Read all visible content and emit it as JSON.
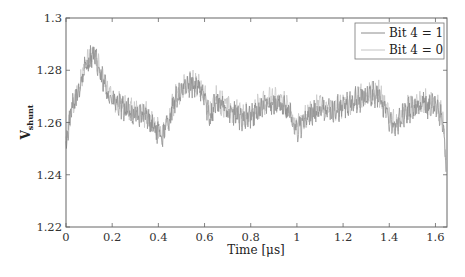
{
  "chart_data": {
    "type": "line",
    "title": "",
    "xlabel": "Time [μs]",
    "ylabel": "V_shunt",
    "ylabel_main": "V",
    "ylabel_sub": "shunt",
    "xlim": [
      0,
      1.65
    ],
    "ylim": [
      1.22,
      1.3
    ],
    "xticks": [
      0,
      0.2,
      0.4,
      0.6,
      0.8,
      1,
      1.2,
      1.4,
      1.6
    ],
    "xtick_labels": [
      "0",
      "0.2",
      "0.4",
      "0.6",
      "0.8",
      "1",
      "1.2",
      "1.4",
      "1.6"
    ],
    "yticks": [
      1.22,
      1.24,
      1.26,
      1.28,
      1.3
    ],
    "ytick_labels": [
      "1.22",
      "1.24",
      "1.26",
      "1.28",
      "1.3"
    ],
    "grid": false,
    "legend_position": "upper right",
    "series": [
      {
        "name": "Bit 4 = 1",
        "color": "#8c8c8c",
        "x": [
          0,
          0.01,
          0.03,
          0.05,
          0.08,
          0.1,
          0.12,
          0.15,
          0.18,
          0.2,
          0.25,
          0.3,
          0.35,
          0.38,
          0.4,
          0.42,
          0.45,
          0.48,
          0.5,
          0.55,
          0.6,
          0.62,
          0.65,
          0.7,
          0.75,
          0.8,
          0.85,
          0.9,
          0.95,
          1.0,
          1.05,
          1.1,
          1.15,
          1.2,
          1.25,
          1.3,
          1.35,
          1.4,
          1.43,
          1.45,
          1.5,
          1.55,
          1.6,
          1.63,
          1.645
        ],
        "values": [
          1.25,
          1.258,
          1.266,
          1.271,
          1.28,
          1.284,
          1.286,
          1.278,
          1.272,
          1.268,
          1.265,
          1.263,
          1.262,
          1.258,
          1.256,
          1.255,
          1.262,
          1.27,
          1.272,
          1.275,
          1.27,
          1.262,
          1.268,
          1.265,
          1.262,
          1.262,
          1.266,
          1.268,
          1.266,
          1.257,
          1.262,
          1.266,
          1.264,
          1.266,
          1.268,
          1.27,
          1.271,
          1.262,
          1.258,
          1.262,
          1.266,
          1.267,
          1.266,
          1.262,
          1.245
        ]
      },
      {
        "name": "Bit 4 = 0",
        "color": "#c4c4c4",
        "x": [
          0,
          0.01,
          0.03,
          0.05,
          0.08,
          0.1,
          0.12,
          0.15,
          0.18,
          0.2,
          0.25,
          0.3,
          0.35,
          0.38,
          0.4,
          0.42,
          0.45,
          0.48,
          0.5,
          0.55,
          0.6,
          0.62,
          0.65,
          0.7,
          0.75,
          0.8,
          0.85,
          0.9,
          0.95,
          1.0,
          1.05,
          1.1,
          1.15,
          1.2,
          1.25,
          1.3,
          1.35,
          1.4,
          1.43,
          1.45,
          1.5,
          1.55,
          1.6,
          1.63,
          1.645
        ],
        "values": [
          1.251,
          1.259,
          1.267,
          1.272,
          1.281,
          1.285,
          1.287,
          1.279,
          1.273,
          1.269,
          1.266,
          1.264,
          1.263,
          1.259,
          1.257,
          1.256,
          1.263,
          1.271,
          1.273,
          1.276,
          1.271,
          1.263,
          1.269,
          1.266,
          1.263,
          1.263,
          1.267,
          1.269,
          1.267,
          1.258,
          1.263,
          1.267,
          1.265,
          1.267,
          1.269,
          1.271,
          1.272,
          1.263,
          1.259,
          1.263,
          1.267,
          1.268,
          1.267,
          1.263,
          1.246
        ]
      }
    ],
    "noise_amplitude": 0.005
  },
  "legend": {
    "items": [
      {
        "label": "Bit 4 = 1",
        "color": "#8c8c8c"
      },
      {
        "label": "Bit 4 = 0",
        "color": "#c4c4c4"
      }
    ]
  }
}
